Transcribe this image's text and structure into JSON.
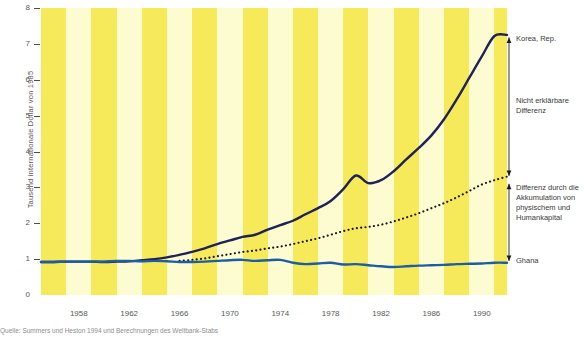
{
  "chart_data": {
    "type": "line",
    "title": "",
    "xlabel": "",
    "ylabel": "Tausend internationale Dollar von 1985",
    "xlim": [
      1955,
      1992
    ],
    "ylim": [
      0,
      8
    ],
    "ytick_labels": [
      "0",
      "1",
      "2",
      "3",
      "4",
      "5",
      "6",
      "7",
      "8"
    ],
    "ytick_values": [
      0,
      1,
      2,
      3,
      4,
      5,
      6,
      7,
      8
    ],
    "xtick_labels": [
      "1958",
      "1962",
      "1966",
      "1970",
      "1974",
      "1978",
      "1982",
      "1986",
      "1990"
    ],
    "xtick_values": [
      1958,
      1962,
      1966,
      1970,
      1974,
      1978,
      1982,
      1986,
      1990
    ],
    "grid": false,
    "legend_position": "right-inline-annotations",
    "series": [
      {
        "name": "Korea, Rep.",
        "style": "solid",
        "color": "#1e2256",
        "x": [
          1955,
          1956,
          1957,
          1958,
          1959,
          1960,
          1961,
          1962,
          1963,
          1964,
          1965,
          1966,
          1967,
          1968,
          1969,
          1970,
          1971,
          1972,
          1973,
          1974,
          1975,
          1976,
          1977,
          1978,
          1979,
          1980,
          1981,
          1982,
          1983,
          1984,
          1985,
          1986,
          1987,
          1988,
          1989,
          1990,
          1991,
          1992
        ],
        "values": [
          0.92,
          0.92,
          0.93,
          0.93,
          0.93,
          0.92,
          0.93,
          0.94,
          0.97,
          1.0,
          1.05,
          1.12,
          1.2,
          1.3,
          1.42,
          1.52,
          1.62,
          1.68,
          1.82,
          1.95,
          2.07,
          2.25,
          2.42,
          2.62,
          2.95,
          3.33,
          3.12,
          3.2,
          3.45,
          3.78,
          4.1,
          4.45,
          4.9,
          5.45,
          6.05,
          6.65,
          7.22,
          7.25
        ]
      },
      {
        "name": "Differenz durch die Akkumulation von physischem und Humankapital",
        "style": "dotted",
        "color": "#1a1a1a",
        "x": [
          1966,
          1967,
          1968,
          1969,
          1970,
          1971,
          1972,
          1973,
          1974,
          1975,
          1976,
          1977,
          1978,
          1979,
          1980,
          1981,
          1982,
          1983,
          1984,
          1985,
          1986,
          1987,
          1988,
          1989,
          1990,
          1991,
          1992
        ],
        "values": [
          0.95,
          0.98,
          1.02,
          1.08,
          1.14,
          1.2,
          1.24,
          1.3,
          1.35,
          1.42,
          1.5,
          1.58,
          1.68,
          1.78,
          1.86,
          1.9,
          1.96,
          2.05,
          2.16,
          2.28,
          2.42,
          2.56,
          2.72,
          2.9,
          3.08,
          3.2,
          3.3
        ]
      },
      {
        "name": "Ghana",
        "style": "solid",
        "color": "#1b5ea8",
        "x": [
          1955,
          1956,
          1957,
          1958,
          1959,
          1960,
          1961,
          1962,
          1963,
          1964,
          1965,
          1966,
          1967,
          1968,
          1969,
          1970,
          1971,
          1972,
          1973,
          1974,
          1975,
          1976,
          1977,
          1978,
          1979,
          1980,
          1981,
          1982,
          1983,
          1984,
          1985,
          1986,
          1987,
          1988,
          1989,
          1990,
          1991,
          1992
        ],
        "values": [
          0.92,
          0.92,
          0.93,
          0.93,
          0.93,
          0.93,
          0.95,
          0.95,
          0.94,
          0.95,
          0.94,
          0.92,
          0.92,
          0.93,
          0.95,
          0.97,
          0.98,
          0.95,
          0.97,
          0.98,
          0.9,
          0.86,
          0.88,
          0.9,
          0.85,
          0.86,
          0.83,
          0.8,
          0.78,
          0.8,
          0.82,
          0.83,
          0.84,
          0.86,
          0.87,
          0.88,
          0.9,
          0.9
        ]
      }
    ],
    "annotations": [
      {
        "name": "korea-label",
        "text": "Korea, Rep."
      },
      {
        "name": "unexplained-difference",
        "text": "Nicht erklärbare Differenz"
      },
      {
        "name": "accumulation-difference",
        "text": "Differenz durch die Akkumulation von physischem und Humankapital"
      },
      {
        "name": "ghana-label",
        "text": "Ghana"
      }
    ]
  },
  "axis": {
    "y_title": "Tausend internationale Dollar von 1985",
    "y_ticks": [
      "8",
      "7",
      "6",
      "5",
      "4",
      "3",
      "2",
      "1",
      "0"
    ],
    "x_ticks": [
      "1958",
      "1962",
      "1966",
      "1970",
      "1974",
      "1978",
      "1982",
      "1986",
      "1990"
    ]
  },
  "annotations": {
    "korea": "Korea, Rep.",
    "unexplained_line1": "Nicht erklärbare",
    "unexplained_line2": "Differenz",
    "accum_line1": "Differenz durch die",
    "accum_line2": "Akkumulation von",
    "accum_line3": "physischem und",
    "accum_line4": "Humankapital",
    "ghana": "Ghana"
  },
  "source": {
    "text": "Quelle: Summers und Heston 1994 und Berechnungen des Weltbank-Stabs"
  },
  "colors": {
    "korea_line": "#1e2256",
    "ghana_line": "#1b5ea8",
    "dotted_line": "#1a1a1a",
    "stripe_dark": "#f7ea5a",
    "stripe_light": "#fdfbd0",
    "text": "#58585a"
  }
}
